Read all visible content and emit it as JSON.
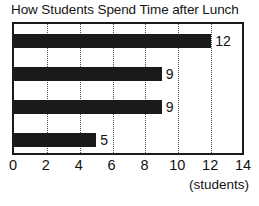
{
  "chart_data": {
    "type": "bar",
    "orientation": "horizontal",
    "title": "How Students Spend Time after Lunch",
    "xlabel": "(students)",
    "ylabel": "",
    "categories": [
      "",
      "",
      "",
      ""
    ],
    "values": [
      12,
      9,
      9,
      5
    ],
    "data_labels": [
      "12",
      "9",
      "9",
      "5"
    ],
    "xlim": [
      0,
      14
    ],
    "xticks": [
      0,
      2,
      4,
      6,
      8,
      10,
      12,
      14
    ],
    "xtick_labels": [
      "0",
      "2",
      "4",
      "6",
      "8",
      "10",
      "12",
      "14"
    ],
    "grid": "vertical-dotted",
    "legend": "none",
    "bar_color": "#1a1a1a",
    "axis_color": "#1a1a1a",
    "grid_color": "#4d4d4d",
    "background": "#ffffff"
  }
}
